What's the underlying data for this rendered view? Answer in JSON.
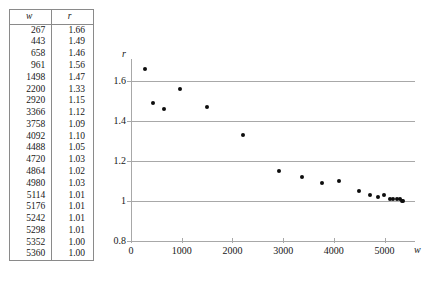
{
  "table": {
    "headers": [
      "w",
      "r"
    ],
    "rows": [
      {
        "w": "267",
        "r": "1.66"
      },
      {
        "w": "443",
        "r": "1.49"
      },
      {
        "w": "658",
        "r": "1.46"
      },
      {
        "w": "961",
        "r": "1.56"
      },
      {
        "w": "1498",
        "r": "1.47"
      },
      {
        "w": "2200",
        "r": "1.33"
      },
      {
        "w": "2920",
        "r": "1.15"
      },
      {
        "w": "3366",
        "r": "1.12"
      },
      {
        "w": "3758",
        "r": "1.09"
      },
      {
        "w": "4092",
        "r": "1.10"
      },
      {
        "w": "4488",
        "r": "1.05"
      },
      {
        "w": "4720",
        "r": "1.03"
      },
      {
        "w": "4864",
        "r": "1.02"
      },
      {
        "w": "4980",
        "r": "1.03"
      },
      {
        "w": "5114",
        "r": "1.01"
      },
      {
        "w": "5176",
        "r": "1.01"
      },
      {
        "w": "5242",
        "r": "1.01"
      },
      {
        "w": "5298",
        "r": "1.01"
      },
      {
        "w": "5352",
        "r": "1.00"
      },
      {
        "w": "5360",
        "r": "1.00"
      }
    ]
  },
  "chart_data": {
    "type": "scatter",
    "title": "",
    "xlabel": "w",
    "ylabel": "r",
    "xlim": [
      0,
      5600
    ],
    "ylim": [
      0.8,
      1.7
    ],
    "xticks": [
      0,
      1000,
      2000,
      3000,
      4000,
      5000
    ],
    "xticklabels": [
      "0",
      "1000",
      "2000",
      "3000",
      "4000",
      "5000"
    ],
    "yticks": [
      0.8,
      1.0,
      1.2,
      1.4,
      1.6
    ],
    "yticklabels": [
      "0.8",
      "1",
      "1.2",
      "1.4",
      "1.6"
    ],
    "grid": "horizontal",
    "legend": "none",
    "marker": "filled-circle",
    "marker_color": "#0d0d0d",
    "grid_color": "#a8a8a8",
    "series": [
      {
        "name": "r vs w",
        "x": [
          267,
          443,
          658,
          961,
          1498,
          2200,
          2920,
          3366,
          3758,
          4092,
          4488,
          4720,
          4864,
          4980,
          5114,
          5176,
          5242,
          5298,
          5352,
          5360
        ],
        "y": [
          1.66,
          1.49,
          1.46,
          1.56,
          1.47,
          1.33,
          1.15,
          1.12,
          1.09,
          1.1,
          1.05,
          1.03,
          1.02,
          1.03,
          1.01,
          1.01,
          1.01,
          1.01,
          1.0,
          1.0
        ]
      }
    ]
  }
}
